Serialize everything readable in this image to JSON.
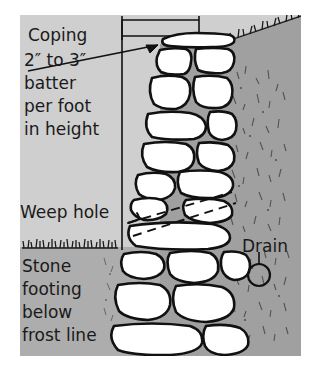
{
  "figure": {
    "background_color": "#ffffff",
    "above_grade_color": "#cfcfcf",
    "below_grade_color": "#a8a8a8",
    "backfill_color": "#9e9e9e",
    "stone_fill": "#ffffff",
    "ink_color": "#111111"
  },
  "labels": {
    "coping": "Coping",
    "batter_line1": "2″ to 3″",
    "batter_line2": "batter",
    "batter_line3": "per foot",
    "batter_line4": "in height",
    "weep_hole": "Weep hole",
    "footing_line1": "Stone",
    "footing_line2": "footing",
    "footing_line3": "below",
    "footing_line4": "frost line",
    "drain": "Drain"
  },
  "annotations": {
    "dimension_bracket": "batter-dimension-bracket",
    "plumb_line": "vertical-plumb-reference-line",
    "leader_arrow": "batter-leader-arrow",
    "weep_hole_channel": "weep-hole-dashed-channel",
    "grade_line_front": "front-grass-grade-line",
    "grade_line_back": "back-sloped-grass-grade-line",
    "drain_pipe": "drain-pipe-circle",
    "drain_leader": "drain-leader-line"
  },
  "stones": {
    "coping_stone": "coping-cap-stone",
    "wall_stone_count": 28,
    "footing_stone_count": 5
  }
}
